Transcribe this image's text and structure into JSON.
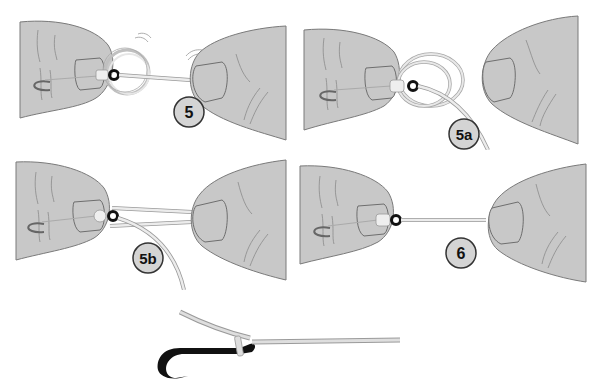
{
  "figure": {
    "colors": {
      "finger_fill": "#c8c8c8",
      "finger_stroke": "#7a7a7a",
      "line_fill": "#e6e6e6",
      "line_stroke": "#9a9a9a",
      "hook_eye": "#111111",
      "badge_fill": "#d4d4d4",
      "badge_stroke": "#333333",
      "background": "#ffffff"
    },
    "steps": [
      {
        "id": "5",
        "label": "5"
      },
      {
        "id": "5a",
        "label": "5a"
      },
      {
        "id": "5b",
        "label": "5b"
      },
      {
        "id": "6",
        "label": "6"
      }
    ],
    "final": {
      "description": "Completed knot on hook"
    },
    "caption": ""
  }
}
